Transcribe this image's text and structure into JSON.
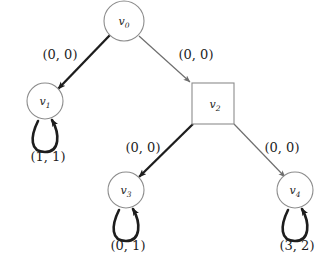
{
  "diagram": {
    "type": "directed-graph",
    "background_color": "#ffffff",
    "stroke_color_node": "#8c8c8c",
    "stroke_color_edge_thin": "#6e6e6e",
    "stroke_color_edge_bold": "#1d1d1d",
    "text_color": "#1d1d1d",
    "nodes": [
      {
        "id": "v0",
        "label_base": "v",
        "label_sub": "0",
        "shape": "circle",
        "cx": 124,
        "cy": 21,
        "r": 20,
        "self_loop": false,
        "weight": null
      },
      {
        "id": "v1",
        "label_base": "v",
        "label_sub": "1",
        "shape": "circle",
        "cx": 45,
        "cy": 101,
        "r": 18,
        "self_loop": true,
        "weight": "(1, 1)"
      },
      {
        "id": "v2",
        "label_base": "v",
        "label_sub": "2",
        "shape": "square",
        "cx": 213,
        "cy": 103,
        "r": 21,
        "self_loop": false,
        "weight": null
      },
      {
        "id": "v3",
        "label_base": "v",
        "label_sub": "3",
        "shape": "circle",
        "cx": 126,
        "cy": 190,
        "r": 18,
        "self_loop": true,
        "weight": "(0, 1)"
      },
      {
        "id": "v4",
        "label_base": "v",
        "label_sub": "4",
        "shape": "circle",
        "cx": 295,
        "cy": 190,
        "r": 18,
        "self_loop": true,
        "weight": "(3, 2)"
      }
    ],
    "edges": [
      {
        "id": "e-v0-v1",
        "from": "v0",
        "to": "v1",
        "label": "(0, 0)",
        "emphasis": "bold",
        "label_x": 60,
        "label_y": 59
      },
      {
        "id": "e-v0-v2",
        "from": "v0",
        "to": "v2",
        "label": "(0, 0)",
        "emphasis": "thin",
        "label_x": 196,
        "label_y": 59
      },
      {
        "id": "e-v2-v3",
        "from": "v2",
        "to": "v3",
        "label": "(0, 0)",
        "emphasis": "bold",
        "label_x": 143,
        "label_y": 152
      },
      {
        "id": "e-v2-v4",
        "from": "v2",
        "to": "v4",
        "label": "(0, 0)",
        "emphasis": "thin",
        "label_x": 282,
        "label_y": 152
      }
    ]
  }
}
